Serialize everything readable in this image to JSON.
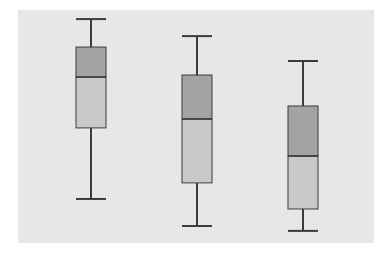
{
  "chart_data": {
    "type": "boxplot",
    "title": "",
    "xlabel": "",
    "ylabel": "",
    "categories": [
      "",
      "",
      ""
    ],
    "ylim": [
      0,
      100
    ],
    "grid": false,
    "legend": null,
    "boxes": [
      {
        "min": 18.9,
        "q1": 49.4,
        "median": 71.2,
        "q3": 84.1,
        "max": 96.1
      },
      {
        "min": 7.3,
        "q1": 25.8,
        "median": 53.2,
        "q3": 72.1,
        "max": 88.8
      },
      {
        "min": 5.2,
        "q1": 14.6,
        "median": 37.3,
        "q3": 58.8,
        "max": 78.1
      }
    ]
  },
  "style": {
    "background": "#e7e7e7",
    "upper_box_fill": "#a3a3a3",
    "lower_box_fill": "#c9c9c9",
    "line_color": "#3c3c3c"
  },
  "layout": {
    "panel": {
      "x": 18,
      "y": 10,
      "w": 356,
      "h": 233
    },
    "box_centers_x": [
      91,
      197,
      303
    ],
    "box_width": 30,
    "cap_width": 30
  }
}
